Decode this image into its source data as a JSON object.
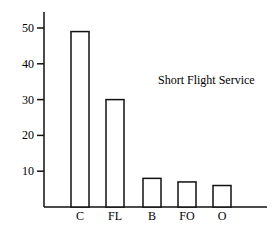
{
  "chart_data": {
    "type": "bar",
    "title": "",
    "annotation": "Short Flight Service",
    "xlabel": "",
    "ylabel": "",
    "categories": [
      "C",
      "FL",
      "B",
      "FO",
      "O"
    ],
    "values": [
      49,
      30,
      8,
      7,
      6
    ],
    "ylim": [
      0,
      50
    ],
    "yticks": [
      10,
      20,
      30,
      40,
      50
    ],
    "grid": false,
    "legend": null,
    "bar_fill": "#ffffff",
    "bar_stroke": "#111111"
  }
}
